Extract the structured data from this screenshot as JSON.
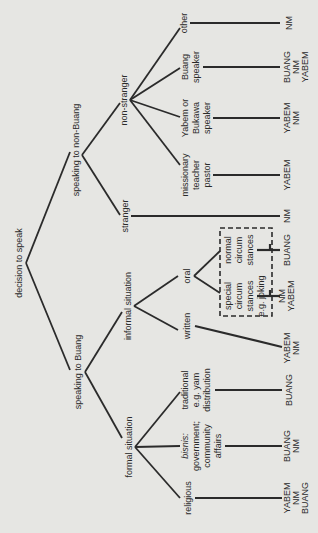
{
  "diagram": {
    "type": "decision-tree",
    "orientation": "rotated-90-ccw",
    "root": "decision to speak",
    "level1": [
      "speaking to non-Buang",
      "speaking to Buang"
    ],
    "non_buang": {
      "label": "speaking to non-Buang",
      "children": [
        "stranger",
        "non-stranger"
      ],
      "stranger": {
        "label": "stranger",
        "outcome": [
          "NM"
        ]
      },
      "non_stranger": {
        "label": "non-stranger",
        "children": [
          {
            "lines": [
              "missionary",
              "teacher",
              "pastor"
            ],
            "outcome": [
              "YABEM"
            ]
          },
          {
            "lines": [
              "Yabem or",
              "Bukawa",
              "speaker"
            ],
            "outcome": [
              "YABEM",
              "NM"
            ]
          },
          {
            "lines": [
              "Buang",
              "speaker"
            ],
            "outcome": [
              "BUANG",
              "NM",
              "YABEM"
            ]
          },
          {
            "lines": [
              "other"
            ],
            "outcome": [
              "NM"
            ]
          }
        ]
      }
    },
    "buang": {
      "label": "speaking to Buang",
      "children": [
        "informal situation",
        "formal situation"
      ],
      "informal": {
        "label": "informal situation",
        "written": {
          "label": "written",
          "outcome": [
            "YABEM",
            "NM"
          ]
        },
        "oral": {
          "label": "oral",
          "children": [
            {
              "lines": [
                "normal",
                "circum",
                "stances"
              ],
              "outcome": [
                "BUANG"
              ]
            },
            {
              "lines": [
                "special",
                "circum",
                "stances",
                "e.g. joking"
              ],
              "outcome": [
                "NM",
                "YABEM"
              ]
            }
          ]
        }
      },
      "formal": {
        "label": "formal situation",
        "children": [
          {
            "lines": [
              "traditional",
              "e.g. yam",
              "distribution"
            ],
            "outcome": [
              "BUANG"
            ]
          },
          {
            "lines": [
              "bisnis:",
              "government;",
              "community",
              "affairs"
            ],
            "outcome": [
              "BUANG",
              "NM"
            ]
          },
          {
            "lines": [
              "religious"
            ],
            "outcome": [
              "YABEM",
              "NM",
              "BUANG"
            ]
          }
        ]
      }
    }
  }
}
